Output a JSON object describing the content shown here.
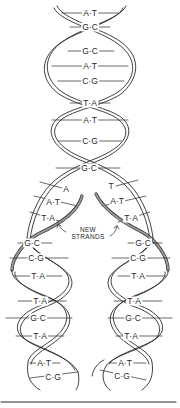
{
  "diagram": {
    "colors": {
      "ink": "#2a2a2a",
      "paper": "#ffffff",
      "strand_fill": "#f2f2f2",
      "new_strand": "#8a8a8a"
    },
    "parent_helix": {
      "base_pairs": [
        {
          "label": "A·T",
          "x": 90,
          "y": 13
        },
        {
          "label": "G·C",
          "x": 90,
          "y": 27
        },
        {
          "label": "G·C",
          "x": 90,
          "y": 51
        },
        {
          "label": "A·T",
          "x": 90,
          "y": 66
        },
        {
          "label": "C·G",
          "x": 90,
          "y": 81
        },
        {
          "label": "T·A",
          "x": 90,
          "y": 103
        },
        {
          "label": "A·T",
          "x": 90,
          "y": 120
        },
        {
          "label": "C·G",
          "x": 90,
          "y": 141
        },
        {
          "label": "G·C",
          "x": 89,
          "y": 168
        }
      ]
    },
    "fork": {
      "base_pairs": [
        {
          "label": "A",
          "x": 66,
          "y": 189
        },
        {
          "label": "T",
          "x": 111,
          "y": 186
        },
        {
          "label": "A·T",
          "x": 53,
          "y": 202
        },
        {
          "label": "A·T",
          "x": 117,
          "y": 201
        },
        {
          "label": "T·A",
          "x": 48,
          "y": 218
        },
        {
          "label": "T·A",
          "x": 131,
          "y": 218
        }
      ],
      "annotation": {
        "line1": "NEW",
        "line2": "STRANDS",
        "x": 88,
        "y": 233
      }
    },
    "left_daughter": {
      "base_pairs": [
        {
          "label": "G·C",
          "x": 32,
          "y": 243
        },
        {
          "label": "C·G",
          "x": 36,
          "y": 258
        },
        {
          "label": "T·A",
          "x": 38,
          "y": 276
        },
        {
          "label": "T·A",
          "x": 40,
          "y": 301
        },
        {
          "label": "G·C",
          "x": 38,
          "y": 318
        },
        {
          "label": "T·A",
          "x": 40,
          "y": 336
        },
        {
          "label": "A·T",
          "x": 44,
          "y": 363
        },
        {
          "label": "C·G",
          "x": 53,
          "y": 377
        }
      ]
    },
    "right_daughter": {
      "base_pairs": [
        {
          "label": "G·C",
          "x": 143,
          "y": 243
        },
        {
          "label": "C·G",
          "x": 138,
          "y": 258
        },
        {
          "label": "T·A",
          "x": 138,
          "y": 276
        },
        {
          "label": "T·A",
          "x": 134,
          "y": 301
        },
        {
          "label": "G·C",
          "x": 133,
          "y": 318
        },
        {
          "label": "T·A",
          "x": 131,
          "y": 336
        },
        {
          "label": "A·T",
          "x": 125,
          "y": 363
        },
        {
          "label": "C·G",
          "x": 122,
          "y": 376
        }
      ]
    }
  }
}
